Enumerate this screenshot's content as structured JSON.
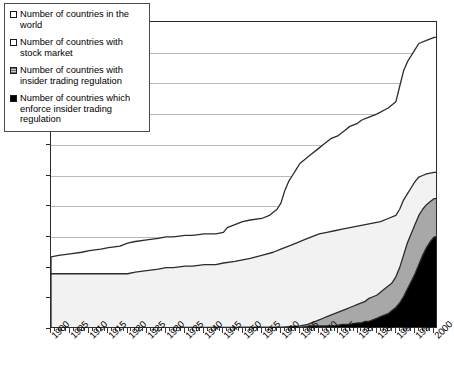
{
  "chart_data": {
    "type": "area",
    "title": "",
    "xlabel": "",
    "ylabel": "",
    "xlim": [
      1900,
      2001
    ],
    "ylim": [
      0,
      200
    ],
    "ytick_step": 20,
    "xtick_step": 5,
    "grid": true,
    "legend_position": "top-left",
    "ytick_labels": [
      "0",
      "20",
      "40",
      "60",
      "80",
      "100",
      "120",
      "140",
      "160",
      "180",
      "200"
    ],
    "xtick_labels": [
      "1900",
      "1905",
      "1910",
      "1915",
      "1920",
      "1925",
      "1930",
      "1935",
      "1940",
      "1945",
      "1950",
      "1955",
      "1960",
      "1965",
      "1970",
      "1975",
      "1980",
      "1985",
      "1990",
      "1995",
      "2000"
    ],
    "series": [
      {
        "name": "Number of countries in the world",
        "fill": "#ffffff",
        "x": [
          1900,
          1902,
          1905,
          1908,
          1910,
          1913,
          1915,
          1918,
          1920,
          1922,
          1925,
          1928,
          1930,
          1932,
          1935,
          1937,
          1940,
          1943,
          1945,
          1946,
          1948,
          1950,
          1952,
          1955,
          1957,
          1958,
          1959,
          1960,
          1961,
          1962,
          1963,
          1964,
          1965,
          1966,
          1967,
          1968,
          1970,
          1971,
          1972,
          1973,
          1975,
          1976,
          1977,
          1978,
          1980,
          1981,
          1983,
          1985,
          1988,
          1990,
          1991,
          1992,
          1993,
          1994,
          1995,
          1996,
          1998,
          2000,
          2001
        ],
        "values": [
          47,
          48,
          49,
          50,
          51,
          52,
          53,
          54,
          56,
          57,
          58,
          59,
          60,
          60,
          61,
          61,
          62,
          62,
          63,
          66,
          68,
          70,
          71,
          72,
          74,
          76,
          78,
          82,
          90,
          96,
          100,
          104,
          108,
          110,
          112,
          114,
          118,
          120,
          122,
          124,
          126,
          128,
          130,
          132,
          134,
          136,
          138,
          140,
          144,
          148,
          158,
          168,
          174,
          178,
          182,
          186,
          188,
          190,
          190
        ]
      },
      {
        "name": "Number of countries with  stock market",
        "fill": "#f2f2f2",
        "x": [
          1900,
          1905,
          1908,
          1910,
          1913,
          1915,
          1918,
          1920,
          1922,
          1925,
          1928,
          1930,
          1932,
          1935,
          1937,
          1940,
          1943,
          1945,
          1948,
          1950,
          1952,
          1955,
          1958,
          1960,
          1962,
          1964,
          1966,
          1968,
          1970,
          1972,
          1974,
          1976,
          1978,
          1980,
          1982,
          1984,
          1986,
          1988,
          1990,
          1991,
          1992,
          1993,
          1994,
          1995,
          1996,
          1997,
          1998,
          2000,
          2001
        ],
        "values": [
          36,
          36,
          36,
          36,
          36,
          36,
          36,
          36,
          37,
          38,
          39,
          40,
          40,
          41,
          41,
          42,
          42,
          43,
          44,
          45,
          46,
          48,
          50,
          52,
          54,
          56,
          58,
          60,
          62,
          63,
          64,
          65,
          66,
          67,
          68,
          69,
          70,
          72,
          74,
          78,
          84,
          88,
          92,
          96,
          99,
          100,
          101,
          102,
          102
        ]
      },
      {
        "name": "Number of countries with insider trading regulation",
        "fill": "#a8a8a8",
        "x": [
          1900,
          1940,
          1950,
          1960,
          1965,
          1967,
          1968,
          1969,
          1970,
          1971,
          1972,
          1973,
          1974,
          1975,
          1976,
          1977,
          1978,
          1979,
          1980,
          1981,
          1982,
          1983,
          1984,
          1985,
          1986,
          1987,
          1988,
          1989,
          1990,
          1991,
          1992,
          1993,
          1994,
          1995,
          1996,
          1997,
          1998,
          1999,
          2000,
          2001
        ],
        "values": [
          0,
          0,
          1,
          1,
          2,
          3,
          4,
          5,
          6,
          7,
          8,
          9,
          10,
          11,
          12,
          13,
          14,
          15,
          16,
          17,
          18,
          20,
          21,
          22,
          24,
          26,
          28,
          30,
          34,
          40,
          48,
          56,
          62,
          68,
          74,
          78,
          81,
          83,
          85,
          85
        ]
      },
      {
        "name": "Number of countries which enforce insider trading regulation",
        "fill": "#000000",
        "x": [
          1900,
          1935,
          1940,
          1950,
          1960,
          1965,
          1968,
          1970,
          1972,
          1974,
          1976,
          1978,
          1980,
          1981,
          1982,
          1983,
          1984,
          1985,
          1986,
          1987,
          1988,
          1989,
          1990,
          1991,
          1992,
          1993,
          1994,
          1995,
          1996,
          1997,
          1998,
          1999,
          2000,
          2001
        ],
        "values": [
          0,
          1,
          1,
          1,
          1,
          1,
          2,
          2,
          2,
          2,
          3,
          3,
          4,
          4,
          5,
          5,
          6,
          7,
          8,
          9,
          10,
          12,
          14,
          17,
          21,
          26,
          31,
          36,
          42,
          48,
          53,
          57,
          60,
          60
        ]
      }
    ]
  },
  "legend": {
    "items": [
      {
        "label": "Number of countries in the world",
        "swatch": "world"
      },
      {
        "label": "Number of countries with  stock market",
        "swatch": "stock"
      },
      {
        "label": "Number of countries with insider trading regulation",
        "swatch": "regulation"
      },
      {
        "label": "Number of countries which enforce insider trading regulation",
        "swatch": "enforcement"
      }
    ]
  }
}
